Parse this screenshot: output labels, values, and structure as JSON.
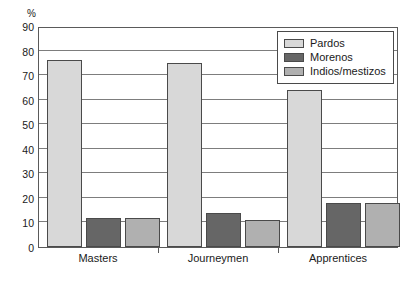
{
  "chart_data": {
    "type": "bar",
    "title": "",
    "subtitle": "",
    "xlabel": "",
    "ylabel": "%",
    "unit_label": "%",
    "categories": [
      "Masters",
      "Journeymen",
      "Apprentices"
    ],
    "series": [
      {
        "name": "Pardos",
        "values": [
          76,
          75,
          64
        ],
        "color": "#d8d8d8"
      },
      {
        "name": "Morenos",
        "values": [
          12,
          14,
          18
        ],
        "color": "#666666"
      },
      {
        "name": "Indios/mestizos",
        "values": [
          12,
          11,
          18
        ],
        "color": "#b0b0b0"
      }
    ],
    "ylim": [
      0,
      90
    ],
    "ytick_step": 10,
    "yticks": [
      0,
      10,
      20,
      30,
      40,
      50,
      60,
      70,
      80,
      90
    ],
    "ytick_labels": [
      "0",
      "10",
      "20",
      "30",
      "40",
      "50",
      "60",
      "70",
      "80",
      "90"
    ],
    "grid": true,
    "grid_axis": "y",
    "legend_position": "top-right",
    "frame": true
  },
  "legend": {
    "entries": [
      {
        "label": "Pardos",
        "color": "#d8d8d8"
      },
      {
        "label": "Morenos",
        "color": "#666666"
      },
      {
        "label": "Indios/mestizos",
        "color": "#b0b0b0"
      }
    ]
  },
  "colors": {
    "pardos": "#d8d8d8",
    "morenos": "#666666",
    "indios_mestizos": "#b0b0b0",
    "axis": "#5a5a5a",
    "grid": "#7d7d7d",
    "bar_border": "#4a4a4a",
    "text": "#1a1a1a",
    "background": "#ffffff"
  }
}
